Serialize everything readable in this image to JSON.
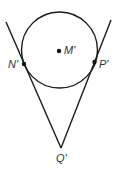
{
  "diagram": {
    "type": "geometry",
    "circle": {
      "center_label": "M'",
      "cx": 59.5,
      "cy": 50,
      "r": 38
    },
    "points": [
      {
        "id": "M",
        "label": "M'",
        "x": 59,
        "y": 51
      },
      {
        "id": "N",
        "label": "N'",
        "x": 24,
        "y": 64
      },
      {
        "id": "P",
        "label": "P'",
        "x": 94.5,
        "y": 62
      },
      {
        "id": "Q",
        "label": "Q'",
        "x": 61,
        "y": 148
      }
    ],
    "segments": [
      {
        "name": "tangent-line-left",
        "from": [
          6,
          22
        ],
        "to": [
          61,
          148
        ]
      },
      {
        "name": "tangent-line-right",
        "from": [
          111,
          20
        ],
        "to": [
          61,
          148
        ]
      }
    ],
    "colors": {
      "stroke": "#1a1a1a",
      "label": "#333333",
      "background": "#ffffff"
    }
  }
}
